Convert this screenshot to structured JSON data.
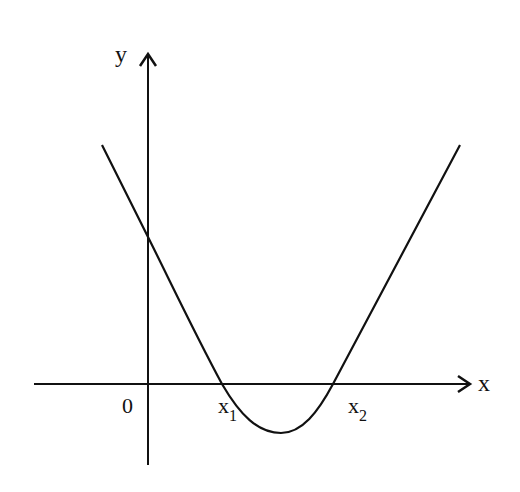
{
  "diagram": {
    "type": "parabola-graph",
    "axes": {
      "x_label": "x",
      "y_label": "y",
      "origin_label": "0"
    },
    "roots": [
      {
        "name": "x",
        "subscript": "1"
      },
      {
        "name": "x",
        "subscript": "2"
      }
    ],
    "colors": {
      "stroke": "#111111",
      "background": "#ffffff"
    }
  }
}
